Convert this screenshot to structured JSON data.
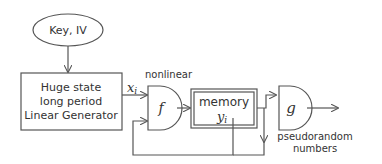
{
  "diagram": {
    "key_node": {
      "label": "Key, IV"
    },
    "linear_generator": {
      "lines": [
        "Huge state",
        "long period",
        "Linear Generator"
      ]
    },
    "output_label": "xi",
    "output_symbol": "x",
    "output_subscript": "i",
    "nonlinear_label": "nonlinear",
    "f_gate": {
      "label": "f"
    },
    "memory": {
      "label": "memory",
      "symbol": "y",
      "subscript": "i"
    },
    "g_gate": {
      "label": "g"
    },
    "output_text": [
      "pseudorandom",
      "numbers"
    ],
    "colors": {
      "stroke": "#555555",
      "text": "#333333",
      "background": "#ffffff"
    }
  }
}
